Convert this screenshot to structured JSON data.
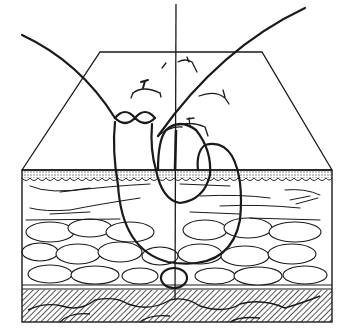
{
  "figure": {
    "style": "black ink line drawing on white",
    "colors": {
      "ink": "#1a1a1a",
      "background": "#ffffff",
      "hatch": "#2a2a2a"
    },
    "layers": [
      {
        "name": "wound-surface",
        "description": "trapezoid skin surface with skin markings"
      },
      {
        "name": "epidermis",
        "description": "stippled wavy band"
      },
      {
        "name": "dermis",
        "description": "streaked fibrous layer"
      },
      {
        "name": "subcutaneous-fat",
        "description": "rounded fat lobules"
      },
      {
        "name": "fascia",
        "description": "thin double line"
      },
      {
        "name": "muscle",
        "description": "diagonally hatched layer"
      }
    ],
    "elements": [
      {
        "name": "suture-thread-left",
        "description": "thread entering from upper left"
      },
      {
        "name": "suture-thread-right",
        "description": "thread exiting to upper right"
      },
      {
        "name": "figure-eight-knot",
        "description": "double loop at wound surface"
      },
      {
        "name": "incision-line",
        "description": "vertical wound line"
      },
      {
        "name": "deep-loop",
        "description": "small loop at fascia level"
      }
    ]
  }
}
